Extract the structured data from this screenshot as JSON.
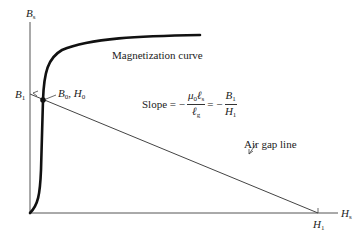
{
  "axes": {
    "y_label": "B",
    "y_label_sub": "s",
    "x_label": "H",
    "x_label_sub": "s"
  },
  "points": {
    "b1_label": "B",
    "b1_sub": "1",
    "h1_label": "H",
    "h1_sub": "1",
    "operating_label_b": "B",
    "operating_label_b_sub": "0",
    "operating_sep": ",",
    "operating_label_h": "H",
    "operating_label_h_sub": "0"
  },
  "curves": {
    "magnetization_label": "Magnetization curve",
    "air_gap_label": "Air gap line"
  },
  "slope": {
    "prefix": "Slope = −",
    "num_mu": "μ",
    "num_mu_sub": "0",
    "num_l": "ℓ",
    "num_l_sub": "s",
    "den_l": "ℓ",
    "den_l_sub": "g",
    "equals": "= −",
    "rhs_num": "B",
    "rhs_num_sub": "1",
    "rhs_den": "H",
    "rhs_den_sub": "1"
  },
  "colors": {
    "ink": "#222222",
    "curve": "#111111",
    "axis": "#555555"
  }
}
